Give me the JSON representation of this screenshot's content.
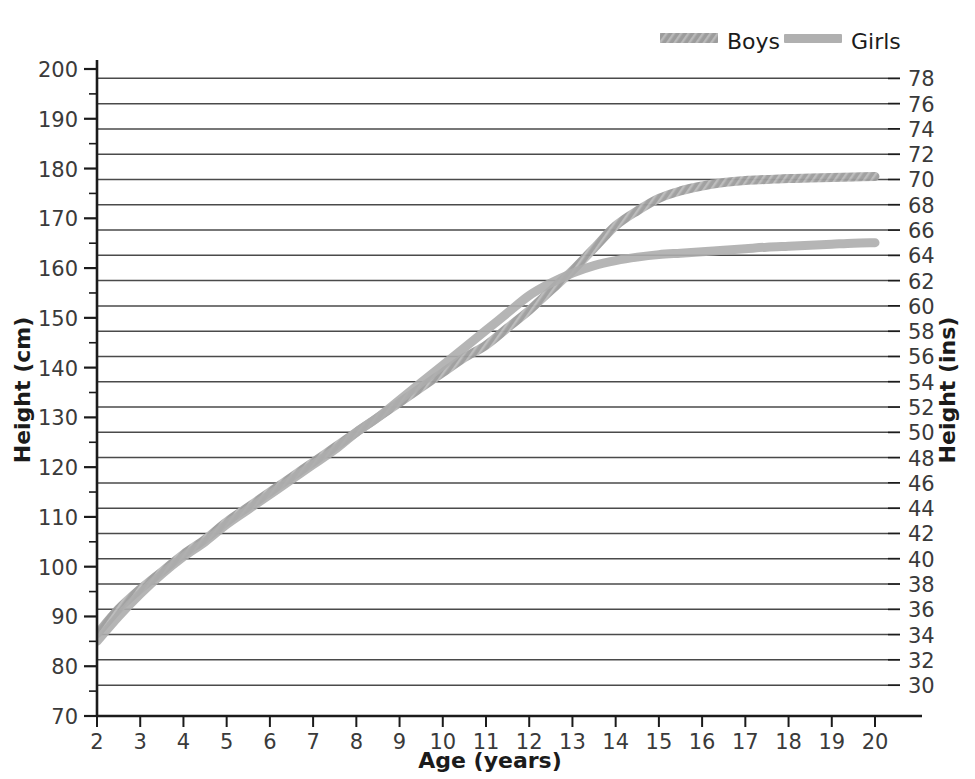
{
  "chart_data": {
    "type": "line",
    "title": "",
    "xlabel": "Age (years)",
    "ylabel": "Height (cm)",
    "ylabel_secondary": "Height (ins)",
    "xlim": [
      2,
      20
    ],
    "ylim": [
      70,
      200
    ],
    "ylim_secondary": [
      29,
      79
    ],
    "grid": true,
    "grid_axis": "y",
    "grid_source": "secondary-inches-every-2",
    "legend_position": "top-right",
    "x_ticks": [
      2,
      3,
      4,
      5,
      6,
      7,
      8,
      9,
      10,
      11,
      12,
      13,
      14,
      15,
      16,
      17,
      18,
      19,
      20
    ],
    "x_tick_labels": [
      "2",
      "3",
      "4",
      "5",
      "6",
      "7",
      "8",
      "9",
      "10",
      "11",
      "12",
      "13",
      "14",
      "15",
      "16",
      "17",
      "18",
      "19",
      "20"
    ],
    "y_ticks_major": [
      70,
      80,
      90,
      100,
      110,
      120,
      130,
      140,
      150,
      160,
      170,
      180,
      190,
      200
    ],
    "y_tick_labels": [
      "70",
      "80",
      "90",
      "100",
      "110",
      "120",
      "130",
      "140",
      "150",
      "160",
      "170",
      "180",
      "190",
      "200"
    ],
    "y_ticks_minor_step": 5,
    "y_ticks_secondary": [
      30,
      32,
      34,
      36,
      38,
      40,
      42,
      44,
      46,
      48,
      50,
      52,
      54,
      56,
      58,
      60,
      62,
      64,
      66,
      68,
      70,
      72,
      74,
      76,
      78
    ],
    "y_tick_labels_secondary": [
      "30",
      "32",
      "34",
      "36",
      "38",
      "40",
      "42",
      "44",
      "46",
      "48",
      "50",
      "52",
      "54",
      "56",
      "58",
      "60",
      "62",
      "64",
      "66",
      "68",
      "70",
      "72",
      "74",
      "76",
      "78"
    ],
    "x": [
      2,
      2.5,
      3,
      3.5,
      4,
      4.5,
      5,
      5.5,
      6,
      6.5,
      7,
      7.5,
      8,
      8.5,
      9,
      9.5,
      10,
      10.5,
      11,
      11.5,
      12,
      12.5,
      13,
      13.5,
      14,
      14.5,
      15,
      15.5,
      16,
      16.5,
      17,
      17.5,
      18,
      18.5,
      19,
      19.5,
      20
    ],
    "series": [
      {
        "name": "Boys",
        "color": "#9a9a9a",
        "style": "hatched",
        "values": [
          86.5,
          91.5,
          95.5,
          99.0,
          102.5,
          105.5,
          109.0,
          112.0,
          115.0,
          118.0,
          121.0,
          124.0,
          127.0,
          130.0,
          133.0,
          136.0,
          139.0,
          142.0,
          144.5,
          148.0,
          151.5,
          155.5,
          159.5,
          164.0,
          168.5,
          171.5,
          174.0,
          175.5,
          176.5,
          177.2,
          177.6,
          177.8,
          178.0,
          178.1,
          178.2,
          178.3,
          178.4
        ]
      },
      {
        "name": "Girls",
        "color": "#adadad",
        "style": "solid",
        "values": [
          85.0,
          90.0,
          94.5,
          98.5,
          102.0,
          105.0,
          108.5,
          111.5,
          114.5,
          117.5,
          120.5,
          123.5,
          127.0,
          130.0,
          133.5,
          137.0,
          140.5,
          144.0,
          147.5,
          151.0,
          154.5,
          157.0,
          159.0,
          160.5,
          161.5,
          162.2,
          162.7,
          163.0,
          163.3,
          163.6,
          163.9,
          164.2,
          164.4,
          164.6,
          164.8,
          165.0,
          165.1
        ]
      }
    ],
    "legend": [
      {
        "label": "Boys",
        "color": "#9a9a9a",
        "style": "hatched"
      },
      {
        "label": "Girls",
        "color": "#adadad",
        "style": "solid"
      }
    ]
  },
  "colors": {
    "axis": "#1b1b1b",
    "grid": "#4a4a4a",
    "tick_text": "#3a3a3a",
    "title_text": "#1b1b1b",
    "background": "#ffffff",
    "boys": "#9a9a9a",
    "girls": "#adadad"
  }
}
